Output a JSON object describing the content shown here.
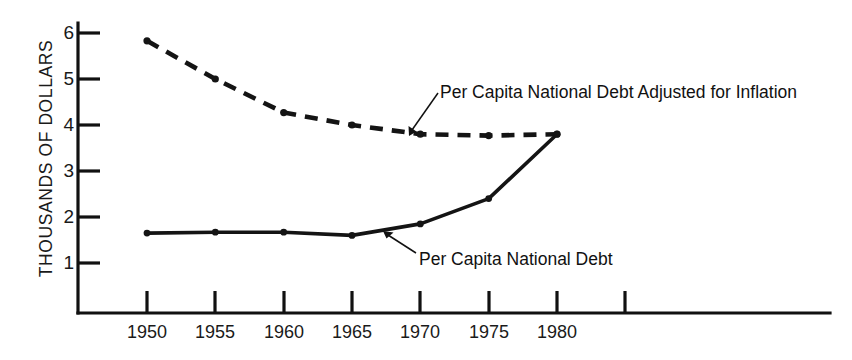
{
  "chart_data": {
    "type": "line",
    "title": "",
    "subtitle": "",
    "xlabel": "",
    "ylabel": "THOUSANDS OF DOLLARS",
    "x": [
      1950,
      1955,
      1960,
      1965,
      1970,
      1975,
      1980
    ],
    "xlim": [
      1946,
      1990
    ],
    "ylim": [
      0,
      6.4
    ],
    "xticks": [
      1950,
      1955,
      1960,
      1965,
      1970,
      1975,
      1980,
      1985
    ],
    "xtick_labels": [
      "1950",
      "1955",
      "1960",
      "1965",
      "1970",
      "1975",
      "1980",
      ""
    ],
    "yticks": [
      1,
      2,
      3,
      4,
      5,
      6
    ],
    "ytick_labels": [
      "1",
      "2",
      "3",
      "4",
      "5",
      "6"
    ],
    "grid": false,
    "legend": "inline-annotations",
    "series": [
      {
        "name": "Per Capita National Debt",
        "style": "solid",
        "color": "#141414",
        "values": [
          1.65,
          1.67,
          1.67,
          1.6,
          1.85,
          2.4,
          3.8
        ]
      },
      {
        "name": "Per Capita National Debt Adjusted for Inflation",
        "style": "dashed",
        "color": "#141414",
        "values": [
          5.83,
          5.0,
          4.27,
          4.0,
          3.8,
          3.77,
          3.8
        ]
      }
    ],
    "annotations": [
      {
        "text": "Per Capita National Debt Adjusted for Inflation",
        "target_series": "Per Capita National Debt Adjusted for Inflation",
        "target_x": 1967,
        "target_y": 3.93
      },
      {
        "text": "Per Capita National Debt",
        "target_series": "Per Capita National Debt",
        "target_x": 1966.5,
        "target_y": 1.64
      }
    ]
  },
  "axis": {
    "y_label": "THOUSANDS OF DOLLARS",
    "y_ticks": [
      "6",
      "5",
      "4",
      "3",
      "2",
      "1"
    ],
    "x_ticks": [
      "1950",
      "1955",
      "1960",
      "1965",
      "1970",
      "1975",
      "1980"
    ]
  },
  "annotations": {
    "adjusted_label": "Per Capita National Debt Adjusted for Inflation",
    "debt_label": "Per Capita National Debt"
  },
  "colors": {
    "ink": "#141414",
    "background": "#ffffff"
  }
}
